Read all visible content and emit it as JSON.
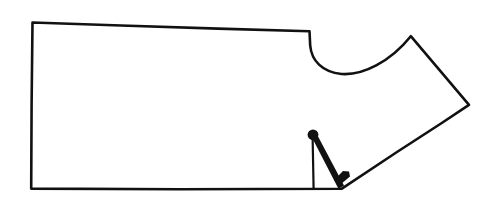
{
  "figure": {
    "title": "Hand-drawn garment pattern piece outline",
    "kind": "line-drawing",
    "canvas": {
      "width": 495,
      "height": 204,
      "background": "#ffffff"
    },
    "ink_color": "#111111",
    "fill_color": "#ffffff",
    "outline": {
      "name": "pattern-outline",
      "stroke_width": 2.6,
      "path": "M 32.5 22.5 L 121 25.5 L 218 28.6 L 309.5 31.2 L 310.2 45.5 C 311.5 60.5 322 72.0 341.5 74.0 C 362.5 75.6 390 62.0 410.8 36.2 L 469.0 104.8 L 441 123.5 L 397 152.0 L 341.5 188.8 L 180 189.2 L 31.2 188.6 L 31.6 105.0 Z"
    },
    "interior_marks": [
      {
        "name": "anchor-dot",
        "type": "circle",
        "cx": 313.0,
        "cy": 134.8,
        "r": 5.4
      },
      {
        "name": "thin-vertical-stem",
        "type": "line",
        "x1": 312.6,
        "y1": 136.5,
        "x2": 313.6,
        "y2": 189.0,
        "stroke_width": 2.2
      },
      {
        "name": "thick-tapered-dart-leg",
        "type": "polygon",
        "points": "311.2,136.0 317.4,135.2 344.0,185.6 338.6,189.0"
      },
      {
        "name": "small-dark-wedge",
        "type": "polygon",
        "points": "334.0,180.2 343.0,171.0 349.0,171.4 350.0,176.6 340.4,184.4"
      }
    ]
  }
}
